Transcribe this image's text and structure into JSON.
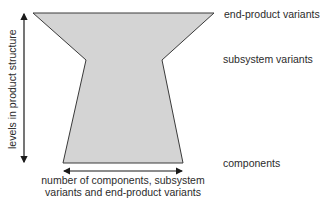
{
  "diagram": {
    "shape": "hourglass-like product variety funnel",
    "fill_color": "#d4d4d4",
    "stroke_color": "#3a3a3a",
    "levels": [
      {
        "label": "end-product variants",
        "position": "top",
        "relative_width": "widest"
      },
      {
        "label": "subsystem variants",
        "position": "middle",
        "relative_width": "narrowest"
      },
      {
        "label": "components",
        "position": "bottom",
        "relative_width": "medium"
      }
    ],
    "vertical_axis_label": "levels in product structure",
    "horizontal_axis_label_line1": "number of components, subsystem",
    "horizontal_axis_label_line2": "variants and end-product variants"
  }
}
